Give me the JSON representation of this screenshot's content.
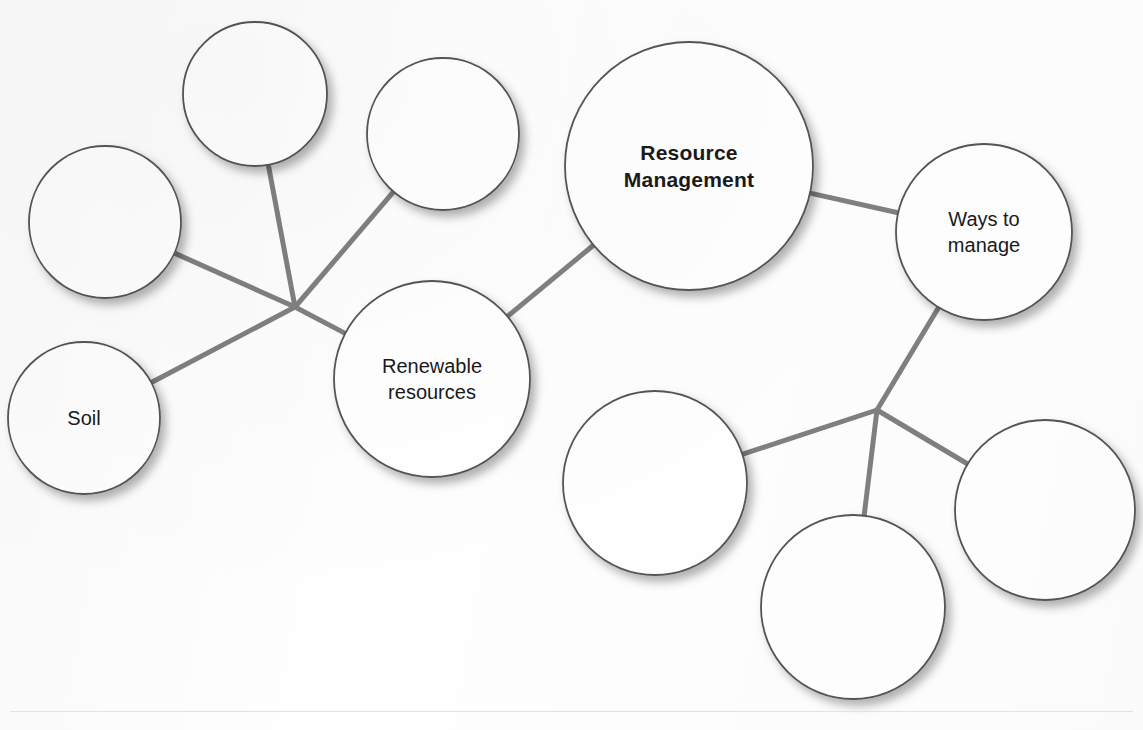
{
  "diagram": {
    "type": "concept-map",
    "title_clipped_top": "",
    "central_node": "Resource Management",
    "line_color": "#808080",
    "circle_stroke_color": "#555555",
    "circle_fill_color": "#ffffff",
    "text_color": "#1a1a1a",
    "nodes": [
      {
        "id": "n1",
        "label": "",
        "cx": 255,
        "cy": 94,
        "r": 72,
        "filled": false,
        "central": false
      },
      {
        "id": "n2",
        "label": "",
        "cx": 443,
        "cy": 134,
        "r": 76,
        "filled": false,
        "central": false
      },
      {
        "id": "n3",
        "label": "",
        "cx": 105,
        "cy": 222,
        "r": 76,
        "filled": false,
        "central": false
      },
      {
        "id": "n4",
        "label": "Soil",
        "cx": 84,
        "cy": 418,
        "r": 76,
        "filled": true,
        "central": false
      },
      {
        "id": "n5",
        "label": "Renewable resources",
        "cx": 432,
        "cy": 379,
        "r": 98,
        "filled": true,
        "central": false
      },
      {
        "id": "n6",
        "label": "Resource Management",
        "cx": 689,
        "cy": 166,
        "r": 124,
        "filled": true,
        "central": true
      },
      {
        "id": "n7",
        "label": "Ways to manage",
        "cx": 984,
        "cy": 232,
        "r": 88,
        "filled": true,
        "central": false
      },
      {
        "id": "n8",
        "label": "",
        "cx": 655,
        "cy": 483,
        "r": 92,
        "filled": false,
        "central": false
      },
      {
        "id": "n9",
        "label": "",
        "cx": 853,
        "cy": 607,
        "r": 92,
        "filled": false,
        "central": false
      },
      {
        "id": "n10",
        "label": "",
        "cx": 1045,
        "cy": 510,
        "r": 90,
        "filled": false,
        "central": false
      }
    ],
    "junctions": [
      {
        "id": "jL",
        "x": 295,
        "y": 307
      },
      {
        "id": "jR",
        "x": 877,
        "y": 410
      }
    ],
    "edges": [
      {
        "from": "n1",
        "to": "jL",
        "label": ""
      },
      {
        "from": "n2",
        "to": "jL",
        "label": ""
      },
      {
        "from": "n3",
        "to": "jL",
        "label": ""
      },
      {
        "from": "n4",
        "to": "jL",
        "label": ""
      },
      {
        "from": "n5",
        "to": "jL",
        "label": ""
      },
      {
        "from": "n5",
        "to": "n6",
        "label": ""
      },
      {
        "from": "n6",
        "to": "n7",
        "label": ""
      },
      {
        "from": "n7",
        "to": "jR",
        "label": ""
      },
      {
        "from": "n8",
        "to": "jR",
        "label": ""
      },
      {
        "from": "n9",
        "to": "jR",
        "label": ""
      },
      {
        "from": "n10",
        "to": "jR",
        "label": ""
      }
    ]
  }
}
